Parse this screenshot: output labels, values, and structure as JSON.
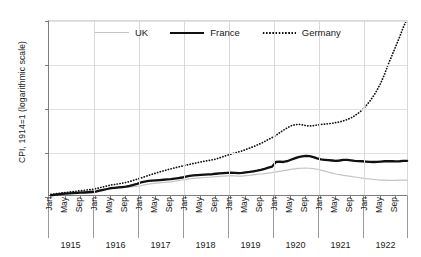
{
  "chart_data": {
    "type": "line",
    "title": "",
    "xlabel": "",
    "ylabel": "CPI, 1914=1 (logarithmic scale)",
    "y_scale": "log",
    "ylim": [
      1,
      625
    ],
    "yticks": [
      1,
      5,
      25,
      125,
      625
    ],
    "ytick_labels": [
      "1",
      "5",
      "25",
      "125",
      "625"
    ],
    "grid": true,
    "legend_position": "top-center",
    "years": [
      "1915",
      "1916",
      "1917",
      "1918",
      "1919",
      "1920",
      "1921",
      "1922"
    ],
    "month_ticks": [
      "Jan",
      "May",
      "Sep"
    ],
    "x": [
      "1915-01",
      "1915-02",
      "1915-03",
      "1915-04",
      "1915-05",
      "1915-06",
      "1915-07",
      "1915-08",
      "1915-09",
      "1915-10",
      "1915-11",
      "1915-12",
      "1916-01",
      "1916-02",
      "1916-03",
      "1916-04",
      "1916-05",
      "1916-06",
      "1916-07",
      "1916-08",
      "1916-09",
      "1916-10",
      "1916-11",
      "1916-12",
      "1917-01",
      "1917-02",
      "1917-03",
      "1917-04",
      "1917-05",
      "1917-06",
      "1917-07",
      "1917-08",
      "1917-09",
      "1917-10",
      "1917-11",
      "1917-12",
      "1918-01",
      "1918-02",
      "1918-03",
      "1918-04",
      "1918-05",
      "1918-06",
      "1918-07",
      "1918-08",
      "1918-09",
      "1918-10",
      "1918-11",
      "1918-12",
      "1919-01",
      "1919-02",
      "1919-03",
      "1919-04",
      "1919-05",
      "1919-06",
      "1919-07",
      "1919-08",
      "1919-09",
      "1919-10",
      "1919-11",
      "1919-12",
      "1920-01",
      "1920-02",
      "1920-03",
      "1920-04",
      "1920-05",
      "1920-06",
      "1920-07",
      "1920-08",
      "1920-09",
      "1920-10",
      "1920-11",
      "1920-12",
      "1921-01",
      "1921-02",
      "1921-03",
      "1921-04",
      "1921-05",
      "1921-06",
      "1921-07",
      "1921-08",
      "1921-09",
      "1921-10",
      "1921-11",
      "1921-12",
      "1922-01",
      "1922-02",
      "1922-03",
      "1922-04",
      "1922-05",
      "1922-06",
      "1922-07",
      "1922-08",
      "1922-09",
      "1922-10",
      "1922-11",
      "1922-12"
    ],
    "series": [
      {
        "name": "UK",
        "color": "#c4c4c4",
        "style": "solid-thin",
        "values": [
          1.1,
          1.12,
          1.14,
          1.16,
          1.18,
          1.19,
          1.2,
          1.2,
          1.21,
          1.22,
          1.24,
          1.26,
          1.28,
          1.3,
          1.32,
          1.34,
          1.36,
          1.38,
          1.4,
          1.41,
          1.42,
          1.44,
          1.46,
          1.48,
          1.52,
          1.56,
          1.6,
          1.63,
          1.66,
          1.68,
          1.7,
          1.72,
          1.74,
          1.78,
          1.82,
          1.86,
          1.9,
          1.94,
          1.98,
          2.0,
          2.02,
          2.04,
          2.06,
          2.08,
          2.1,
          2.12,
          2.14,
          2.16,
          2.18,
          2.16,
          2.14,
          2.15,
          2.18,
          2.2,
          2.24,
          2.28,
          2.32,
          2.36,
          2.4,
          2.44,
          2.5,
          2.56,
          2.62,
          2.68,
          2.74,
          2.8,
          2.84,
          2.86,
          2.88,
          2.86,
          2.82,
          2.76,
          2.68,
          2.58,
          2.48,
          2.4,
          2.32,
          2.26,
          2.2,
          2.16,
          2.12,
          2.08,
          2.04,
          2.0,
          1.96,
          1.93,
          1.9,
          1.88,
          1.86,
          1.85,
          1.84,
          1.84,
          1.84,
          1.85,
          1.86,
          1.86
        ]
      },
      {
        "name": "France",
        "color": "#111111",
        "style": "solid-thick",
        "values": [
          1.06,
          1.08,
          1.1,
          1.12,
          1.13,
          1.14,
          1.15,
          1.16,
          1.17,
          1.18,
          1.19,
          1.2,
          1.22,
          1.26,
          1.3,
          1.34,
          1.38,
          1.4,
          1.42,
          1.44,
          1.46,
          1.5,
          1.56,
          1.62,
          1.7,
          1.76,
          1.8,
          1.82,
          1.84,
          1.86,
          1.88,
          1.9,
          1.92,
          1.96,
          2.0,
          2.04,
          2.1,
          2.16,
          2.2,
          2.22,
          2.24,
          2.26,
          2.28,
          2.3,
          2.34,
          2.38,
          2.4,
          2.42,
          2.44,
          2.42,
          2.4,
          2.42,
          2.46,
          2.5,
          2.56,
          2.62,
          2.7,
          2.8,
          2.92,
          3.04,
          3.6,
          3.64,
          3.6,
          3.7,
          3.9,
          4.1,
          4.3,
          4.4,
          4.5,
          4.45,
          4.3,
          4.1,
          3.95,
          3.9,
          3.85,
          3.8,
          3.75,
          3.8,
          3.9,
          3.88,
          3.82,
          3.76,
          3.72,
          3.7,
          3.66,
          3.62,
          3.6,
          3.62,
          3.66,
          3.7,
          3.72,
          3.7,
          3.68,
          3.7,
          3.74,
          3.76
        ]
      },
      {
        "name": "Germany",
        "color": "#111111",
        "style": "dotted",
        "values": [
          1.1,
          1.12,
          1.14,
          1.16,
          1.18,
          1.2,
          1.22,
          1.24,
          1.26,
          1.28,
          1.3,
          1.32,
          1.36,
          1.4,
          1.45,
          1.5,
          1.55,
          1.58,
          1.62,
          1.66,
          1.7,
          1.76,
          1.84,
          1.92,
          2.0,
          2.1,
          2.2,
          2.3,
          2.4,
          2.5,
          2.6,
          2.7,
          2.8,
          2.9,
          3.0,
          3.1,
          3.2,
          3.3,
          3.4,
          3.5,
          3.6,
          3.7,
          3.8,
          3.9,
          4.0,
          4.2,
          4.4,
          4.6,
          4.8,
          5.0,
          5.2,
          5.4,
          5.7,
          6.0,
          6.3,
          6.7,
          7.1,
          7.6,
          8.2,
          8.8,
          9.5,
          10.5,
          11.5,
          12.5,
          13.5,
          14.0,
          14.3,
          14.0,
          13.6,
          13.4,
          13.6,
          13.9,
          14.2,
          14.4,
          14.6,
          14.8,
          15.2,
          15.6,
          16.2,
          17.0,
          18.0,
          19.5,
          21.5,
          24.0,
          28.0,
          33.0,
          40.0,
          50.0,
          65.0,
          90.0,
          130.0,
          180.0,
          250.0,
          350.0,
          500.0,
          680.0
        ]
      }
    ]
  },
  "legend": {
    "entries": [
      {
        "label": "UK"
      },
      {
        "label": "France"
      },
      {
        "label": "Germany"
      }
    ]
  },
  "axis": {
    "y_title": "CPI, 1914=1 (logarithmic scale)"
  }
}
